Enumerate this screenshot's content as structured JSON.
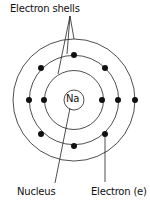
{
  "diagram": {
    "labels": {
      "shells": "Electron shells",
      "nucleus": "Nucleus",
      "electron": "Electron (e)",
      "element_symbol": "Na"
    },
    "center": [
      74,
      100
    ],
    "nucleus_radius": 10,
    "shells": [
      {
        "name": "shell-1",
        "radius": 29.5,
        "electrons": 2
      },
      {
        "name": "shell-2",
        "radius": 44.7,
        "electrons": 8
      },
      {
        "name": "shell-3",
        "radius": 61,
        "electrons": 1
      }
    ],
    "colors": {
      "line": "#222222",
      "electron": "#111111",
      "background": "#ffffff"
    }
  }
}
